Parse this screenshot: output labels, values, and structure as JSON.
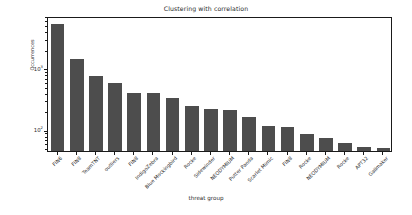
{
  "chart_data": {
    "type": "bar",
    "title": "Clustering with correlation",
    "xlabel": "threat group",
    "ylabel": "Occurrences",
    "yscale": "log",
    "ylim": [
      45,
      7000
    ],
    "grid": false,
    "legend": null,
    "categories": [
      "FIN6",
      "FIN8",
      "TeamTNT",
      "outliers",
      "FIN8",
      "IndigoZebra",
      "Blue Mockingbird",
      "Rocke",
      "Sidewinder",
      "NEODYMIUM",
      "Putter Panda",
      "Scarlet Mimic",
      "FIN8",
      "Rocke",
      "NEODYMIUM",
      "Rocke",
      "APT32",
      "Gallmaker"
    ],
    "values": [
      5200,
      1400,
      740,
      570,
      395,
      390,
      330,
      240,
      215,
      212,
      160,
      115,
      112,
      86,
      72,
      60,
      53,
      50
    ],
    "ytick_values": [
      100,
      1000
    ],
    "ytick_labels": [
      "10²",
      "10³"
    ],
    "ytick_mantissas": [
      "10",
      "10"
    ],
    "ytick_exponents": [
      "2",
      "3"
    ],
    "bar_color": "#4d4d4d"
  }
}
